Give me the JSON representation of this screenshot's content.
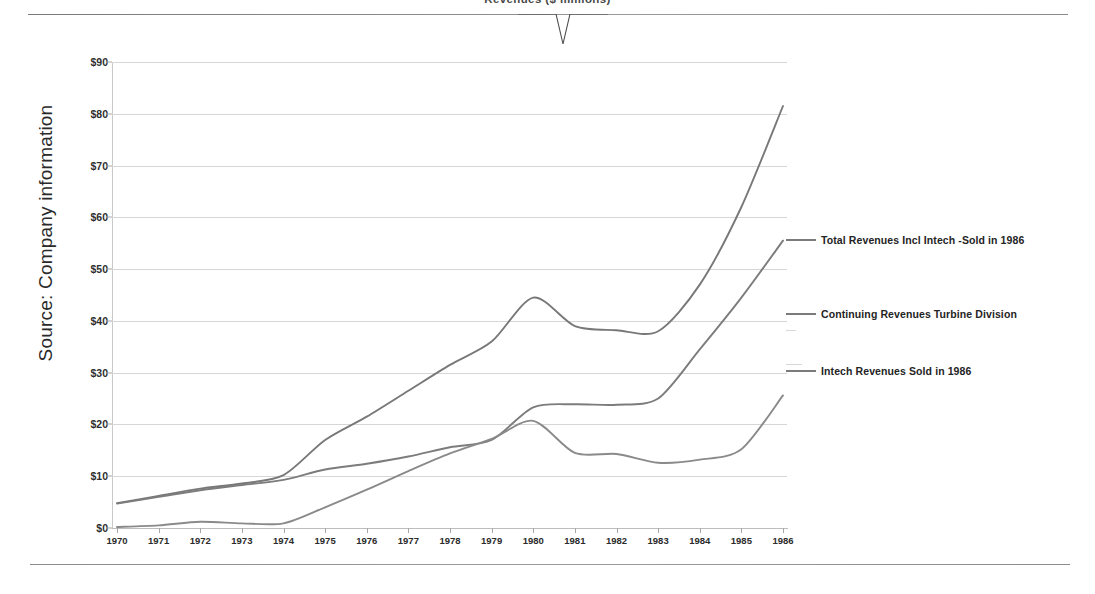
{
  "slide": {
    "title_clipped": "Revenues  ($ millions)",
    "source_label": "Source: Company information"
  },
  "legend": {
    "position": "right",
    "entries": [
      {
        "name": "total-revenues-incl-intech",
        "label": "Total Revenues Incl Intech -Sold in 1986",
        "color": "#7b7b7b",
        "y": 241
      },
      {
        "name": "continuing-revenues-turbine-division",
        "label": "Continuing Revenues Turbine Division",
        "color": "#7b7b7b",
        "y": 315
      },
      {
        "name": "intech-revenues-sold-in-1986",
        "label": "Intech Revenues Sold in 1986",
        "color": "#7b7b7b",
        "y": 372
      }
    ]
  },
  "chart_data": {
    "type": "line",
    "title": "Revenues ($ millions)",
    "xlabel": "",
    "ylabel": "Source: Company information",
    "grid": true,
    "legend_position": "right",
    "ylim": [
      0,
      90
    ],
    "ytick_step": 10,
    "ytick_labels": [
      "$0",
      "$10",
      "$20",
      "$30",
      "$40",
      "$50",
      "$60",
      "$70",
      "$80",
      "$90"
    ],
    "ytick_values": [
      0,
      10,
      20,
      30,
      40,
      50,
      60,
      70,
      80,
      90
    ],
    "categories": [
      "1970",
      "1971",
      "1972",
      "1973",
      "1974",
      "1975",
      "1976",
      "1977",
      "1978",
      "1979",
      "1980",
      "1981",
      "1982",
      "1983",
      "1984",
      "1985",
      "1986"
    ],
    "x": [
      1970,
      1971,
      1972,
      1973,
      1974,
      1975,
      1976,
      1977,
      1978,
      1979,
      1980,
      1981,
      1982,
      1983,
      1984,
      1985,
      1986
    ],
    "series": [
      {
        "name": "Total Revenues Incl Intech -Sold in 1986",
        "color": "#787878",
        "values": [
          4.8,
          6.2,
          7.6,
          8.6,
          10.2,
          17.0,
          21.5,
          26.5,
          31.5,
          36.0,
          44.5,
          39.0,
          38.2,
          38.0,
          47.0,
          62.0,
          81.5
        ]
      },
      {
        "name": "Continuing Revenues Turbine Division",
        "color": "#7c7c7c",
        "values": [
          4.7,
          6.0,
          7.3,
          8.3,
          9.3,
          11.3,
          12.4,
          13.8,
          15.6,
          17.0,
          23.3,
          23.9,
          23.8,
          25.0,
          34.5,
          44.5,
          55.5
        ]
      },
      {
        "name": "Intech Revenues Sold in 1986",
        "color": "#8a8a8a",
        "values": [
          0.2,
          0.5,
          1.2,
          0.9,
          0.9,
          4.0,
          7.4,
          11.0,
          14.4,
          17.2,
          20.7,
          14.5,
          14.3,
          12.6,
          13.2,
          15.2,
          25.6
        ]
      }
    ]
  }
}
